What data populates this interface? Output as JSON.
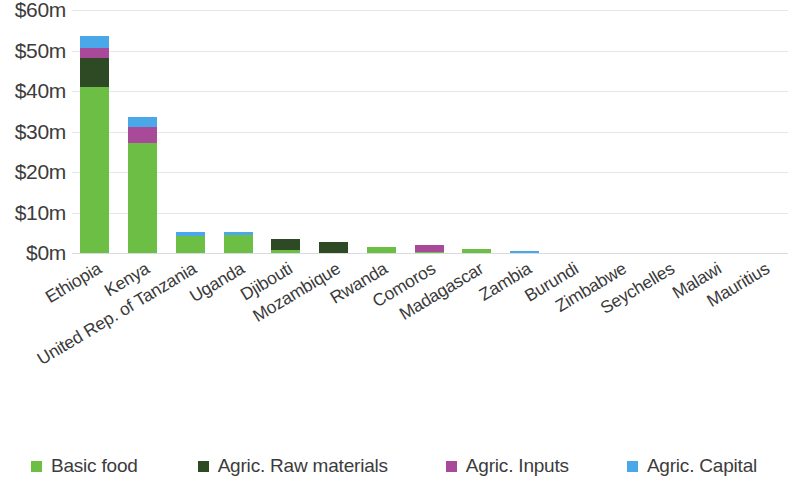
{
  "chart_data": {
    "type": "bar",
    "subtype": "stacked-vertical",
    "title": "",
    "subtitle": "",
    "xlabel": "",
    "ylabel": "",
    "ylim": [
      0,
      60
    ],
    "y_unit": "$m",
    "y_ticks": [
      0,
      10,
      20,
      30,
      40,
      50,
      60
    ],
    "y_tick_labels": [
      "$0m",
      "$10m",
      "$20m",
      "$30m",
      "$40m",
      "$50m",
      "$60m"
    ],
    "grid": true,
    "grid_axis": "y",
    "legend_position": "bottom",
    "categories": [
      "Ethiopia",
      "Kenya",
      "United Rep. of Tanzania",
      "Uganda",
      "Djibouti",
      "Mozambique",
      "Rwanda",
      "Comoros",
      "Madagascar",
      "Zambia",
      "Burundi",
      "Zimbabwe",
      "Seychelles",
      "Malawi",
      "Mauritius"
    ],
    "series": [
      {
        "name": "Basic food",
        "color": "#6cbe45",
        "values": [
          41.0,
          27.2,
          4.3,
          4.5,
          0.7,
          0.0,
          1.5,
          0.15,
          1.0,
          0.0,
          0.0,
          0.0,
          0.0,
          0.0,
          0.0
        ]
      },
      {
        "name": "Agric. Raw materials",
        "color": "#2d4a24",
        "values": [
          7.2,
          0.0,
          0.0,
          0.0,
          2.8,
          2.8,
          0.0,
          0.0,
          0.0,
          0.0,
          0.0,
          0.0,
          0.0,
          0.0,
          0.0
        ]
      },
      {
        "name": "Agric. Inputs",
        "color": "#a8499a",
        "values": [
          2.3,
          4.0,
          0.0,
          0.0,
          0.0,
          0.0,
          0.0,
          1.75,
          0.0,
          0.0,
          0.0,
          0.0,
          0.0,
          0.0,
          0.0
        ]
      },
      {
        "name": "Agric. Capital",
        "color": "#4aa8e8",
        "values": [
          3.0,
          2.4,
          1.0,
          0.7,
          0.0,
          0.0,
          0.0,
          0.0,
          0.0,
          0.4,
          0.0,
          0.0,
          0.0,
          0.0,
          0.0
        ]
      }
    ],
    "totals": [
      53.5,
      33.6,
      5.3,
      5.2,
      3.5,
      2.8,
      1.5,
      1.9,
      1.0,
      0.4,
      0.0,
      0.0,
      0.0,
      0.0,
      0.0
    ]
  },
  "legend": {
    "items": [
      {
        "label": "Basic food",
        "color": "#6cbe45"
      },
      {
        "label": "Agric. Raw materials",
        "color": "#2d4a24"
      },
      {
        "label": "Agric. Inputs",
        "color": "#a8499a"
      },
      {
        "label": "Agric. Capital",
        "color": "#4aa8e8"
      }
    ]
  },
  "colors": {
    "background": "#ffffff",
    "grid": "#e3e6ea",
    "text": "#3c3c3c"
  }
}
